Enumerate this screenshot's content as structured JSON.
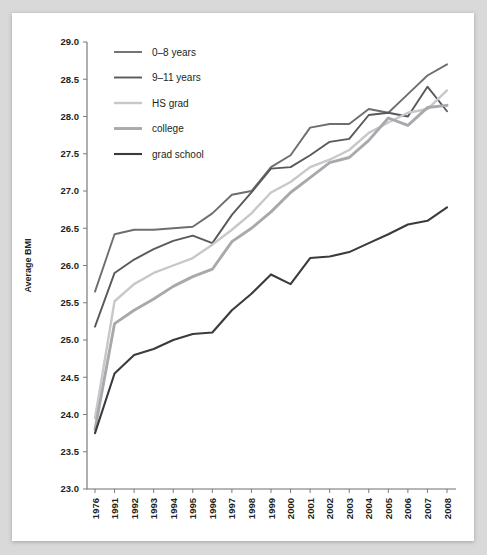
{
  "figure": {
    "background_color": "#d9d9d9",
    "paper_color": "#ffffff",
    "axis_color": "#6d6e71",
    "text_color": "#231f20"
  },
  "legend": {
    "position": "top-left",
    "entries": [
      {
        "label": "0–8 years",
        "color": "#6d6e71"
      },
      {
        "label": "9–11 years",
        "color": "#58595b"
      },
      {
        "label": "HS grad",
        "color": "#c7c8ca"
      },
      {
        "label": "college",
        "color": "#a7a9ac"
      },
      {
        "label": "grad school",
        "color": "#3b3b3d"
      }
    ]
  },
  "chart_data": {
    "type": "line",
    "title": "",
    "xlabel": "",
    "ylabel": "Average BMI",
    "ylim": [
      23.0,
      29.0
    ],
    "ytick_step": 0.5,
    "grid": false,
    "legend_position": "top-left",
    "yticks": [
      "29.0",
      "28.5",
      "28.0",
      "27.5",
      "27.0",
      "26.5",
      "26.0",
      "25.5",
      "25.0",
      "24.5",
      "24.0",
      "23.5",
      "23.0"
    ],
    "categories": [
      "1976",
      "1991",
      "1992",
      "1993",
      "1994",
      "1995",
      "1996",
      "1997",
      "1998",
      "1999",
      "2000",
      "2001",
      "2002",
      "2003",
      "2004",
      "2005",
      "2006",
      "2007",
      "2008"
    ],
    "series": [
      {
        "name": "0–8 years",
        "color": "#6d6e71",
        "width": 1.9,
        "values": [
          25.65,
          26.42,
          26.48,
          26.48,
          26.5,
          26.52,
          26.7,
          26.95,
          27.0,
          27.32,
          27.48,
          27.85,
          27.9,
          27.9,
          28.1,
          28.05,
          28.3,
          28.55,
          28.7
        ]
      },
      {
        "name": "9–11 years",
        "color": "#58595b",
        "width": 1.9,
        "values": [
          25.18,
          25.9,
          26.08,
          26.22,
          26.33,
          26.4,
          26.3,
          26.68,
          26.98,
          27.3,
          27.32,
          27.48,
          27.66,
          27.7,
          28.02,
          28.05,
          28.0,
          28.4,
          28.07
        ]
      },
      {
        "name": "HS grad",
        "color": "#c7c8ca",
        "width": 2.4,
        "values": [
          23.95,
          25.52,
          25.75,
          25.9,
          26.0,
          26.1,
          26.28,
          26.48,
          26.7,
          26.98,
          27.12,
          27.32,
          27.42,
          27.55,
          27.78,
          27.92,
          28.05,
          28.1,
          28.35
        ]
      },
      {
        "name": "college",
        "color": "#a7a9ac",
        "width": 2.9,
        "values": [
          23.8,
          25.22,
          25.4,
          25.55,
          25.72,
          25.85,
          25.95,
          26.32,
          26.5,
          26.72,
          26.98,
          27.18,
          27.38,
          27.45,
          27.68,
          27.98,
          27.88,
          28.12,
          28.15
        ]
      },
      {
        "name": "grad school",
        "color": "#3b3b3d",
        "width": 2.1,
        "values": [
          23.75,
          24.55,
          24.8,
          24.88,
          25.0,
          25.08,
          25.1,
          25.4,
          25.62,
          25.88,
          25.75,
          26.1,
          26.12,
          26.18,
          26.3,
          26.42,
          26.55,
          26.6,
          26.78
        ]
      }
    ]
  }
}
